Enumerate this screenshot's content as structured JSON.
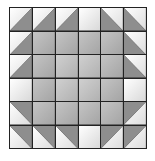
{
  "grid": {
    "rows": 6,
    "cols": 6
  },
  "colors": {
    "light": "#f2f2f2",
    "mid": "#b4b4b4",
    "dark": "#8e8e8e",
    "line": "#222222",
    "center": "#c8c8c8"
  },
  "cells": [
    [
      "tl-light",
      "tl-light",
      "tl-light",
      "plain-light",
      "tr-light",
      "tr-light"
    ],
    [
      "tl-light",
      "mid",
      "mid",
      "mid",
      "mid",
      "tr-light"
    ],
    [
      "tl-light",
      "mid",
      "center",
      "center",
      "mid",
      "tr-light"
    ],
    [
      "plain-light",
      "mid",
      "center",
      "center",
      "mid",
      "plain-light"
    ],
    [
      "bl-light",
      "mid",
      "mid",
      "mid",
      "mid",
      "br-light"
    ],
    [
      "bl-light",
      "bl-light",
      "bl-light",
      "plain-light",
      "br-light",
      "br-light"
    ]
  ]
}
